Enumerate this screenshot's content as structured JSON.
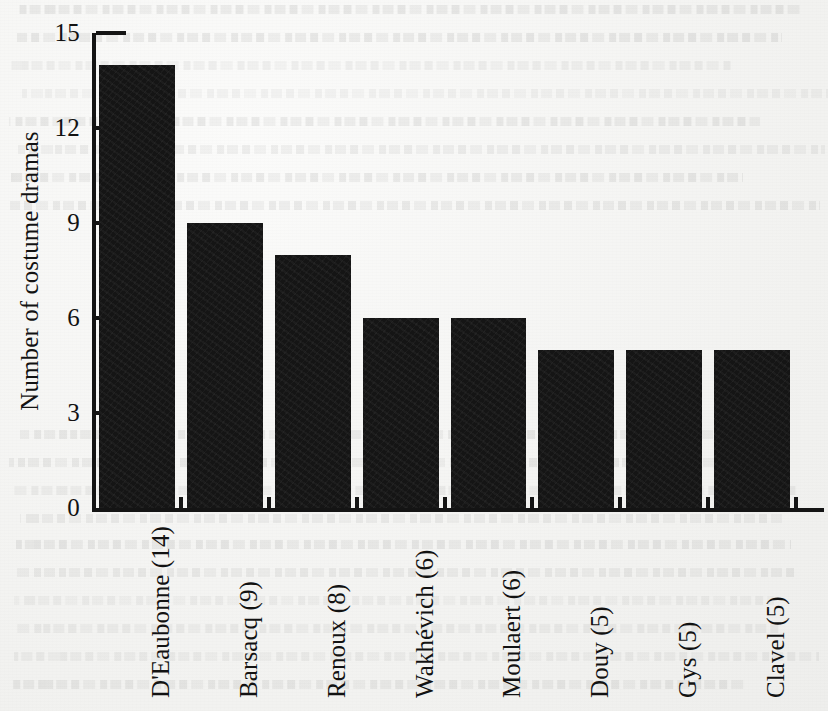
{
  "chart_data": {
    "type": "bar",
    "title": "",
    "subtitle": "",
    "xlabel": "",
    "ylabel": "Number of costume dramas",
    "categories": [
      "D'Eaubonne (14)",
      "Barsacq (9)",
      "Renoux (8)",
      "Wakhévich (6)",
      "Moulaert (6)",
      "Douy (5)",
      "Gys (5)",
      "Clavel (5)"
    ],
    "names": [
      "D'Eaubonne",
      "Barsacq",
      "Renoux",
      "Wakhévich",
      "Moulaert",
      "Douy",
      "Gys",
      "Clavel"
    ],
    "values": [
      14,
      9,
      8,
      6,
      6,
      5,
      5,
      5
    ],
    "ylim": [
      0,
      15
    ],
    "yticks": [
      0,
      3,
      6,
      9,
      12,
      15
    ],
    "ytick_labels": [
      "0",
      "3",
      "6",
      "9",
      "12",
      "15"
    ],
    "grid": false,
    "legend": false,
    "legend_position": "none",
    "bar_color": "#151515",
    "axis_color": "#141414",
    "background_color": "#f4f4f2",
    "orientation": "vertical",
    "label_rotation": -90
  }
}
